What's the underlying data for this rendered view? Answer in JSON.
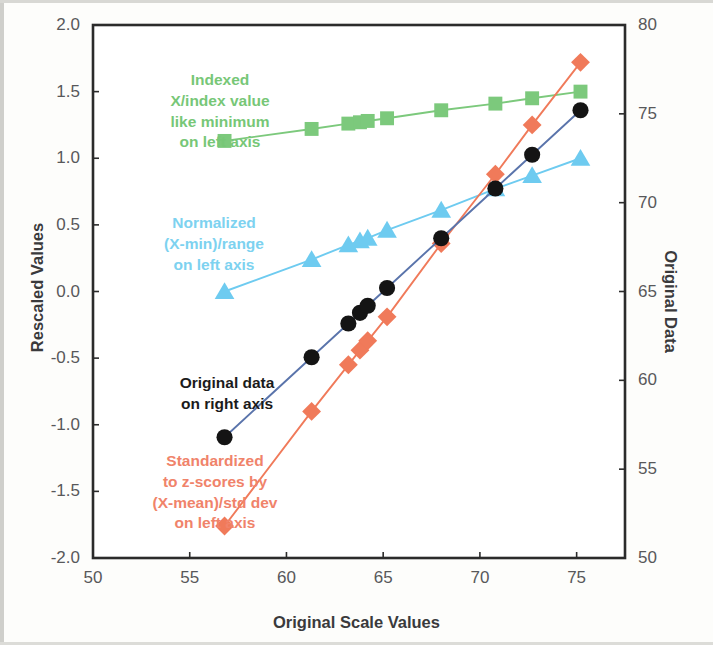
{
  "chart_data": {
    "type": "scatter",
    "title": "",
    "xlabel": "Original Scale Values",
    "ylabel": "Rescaled Values",
    "ylabel_right": "Original Data",
    "xlim": [
      50,
      77.5
    ],
    "ylim": [
      -2.0,
      2.0
    ],
    "ylim_right": [
      50,
      80
    ],
    "grid": false,
    "legend": "in-plot annotations",
    "xticks": [
      "50",
      "55",
      "60",
      "65",
      "70",
      "75"
    ],
    "xtick_values": [
      50,
      55,
      60,
      65,
      70,
      75
    ],
    "yticks_left": [
      "2.0",
      "1.5",
      "1.0",
      "0.5",
      "0.0",
      "-0.5",
      "-1.0",
      "-1.5",
      "-2.0"
    ],
    "ytick_values_left": [
      2.0,
      1.5,
      1.0,
      0.5,
      0.0,
      -0.5,
      -1.0,
      -1.5,
      -2.0
    ],
    "yticks_right": [
      "80",
      "75",
      "70",
      "65",
      "60",
      "55",
      "50"
    ],
    "ytick_values_right": [
      80,
      75,
      70,
      65,
      60,
      55,
      50
    ],
    "x": [
      56.8,
      61.3,
      63.2,
      63.8,
      64.2,
      65.2,
      68.0,
      70.8,
      72.7,
      75.2
    ],
    "series": [
      {
        "name": "Indexed",
        "description": "X/index value like minimum on left axis",
        "color": "#7cc97c",
        "marker": "square",
        "axis": "left",
        "values": [
          1.13,
          1.22,
          1.26,
          1.27,
          1.28,
          1.3,
          1.36,
          1.41,
          1.45,
          1.5
        ]
      },
      {
        "name": "Normalized",
        "description": "(X-min)/range on left axis",
        "color": "#6ecbf0",
        "marker": "triangle",
        "axis": "left",
        "values": [
          0.0,
          0.24,
          0.35,
          0.38,
          0.4,
          0.46,
          0.61,
          0.77,
          0.87,
          1.0
        ]
      },
      {
        "name": "Original data",
        "description": "on right axis",
        "color": "#141414",
        "line_color": "#5a74ab",
        "marker": "circle",
        "axis": "right",
        "values_left_equiv": [
          -1.08,
          -0.47,
          -0.24,
          -0.18,
          -0.12,
          0.02,
          0.4,
          0.77,
          1.04,
          1.37
        ],
        "values": [
          56.8,
          61.3,
          63.2,
          63.8,
          64.2,
          65.2,
          68.0,
          70.8,
          72.7,
          75.2
        ]
      },
      {
        "name": "Standardized",
        "description": "to z-scores by (X-mean)/std dev on left axis",
        "color": "#f07a5a",
        "marker": "diamond",
        "axis": "left",
        "values": [
          -1.76,
          -0.9,
          -0.55,
          -0.44,
          -0.37,
          -0.19,
          0.36,
          0.88,
          1.25,
          1.72
        ]
      }
    ],
    "annotations": [
      {
        "id": "indexed",
        "lines": [
          "Indexed",
          "X/index value",
          "like minimum",
          "on left axis"
        ],
        "color": "#77c777"
      },
      {
        "id": "normalized",
        "lines": [
          "Normalized",
          "(X-min)/range",
          "on left axis"
        ],
        "color": "#7dd2f0"
      },
      {
        "id": "original",
        "lines": [
          "Original data",
          "on right axis"
        ],
        "color": "#1b1b1b"
      },
      {
        "id": "standardized",
        "lines": [
          "Standardized",
          "to z-scores by",
          "(X-mean)/std dev",
          "on left axis"
        ],
        "color": "#f0836a"
      }
    ]
  },
  "annot_text": {
    "indexed": "Indexed\nX/index value\nlike minimum\non left axis",
    "normalized": "Normalized\n(X-min)/range\non left axis",
    "original": "Original data\non right axis",
    "standardized": "Standardized\nto z-scores by\n(X-mean)/std dev\non left axis"
  }
}
